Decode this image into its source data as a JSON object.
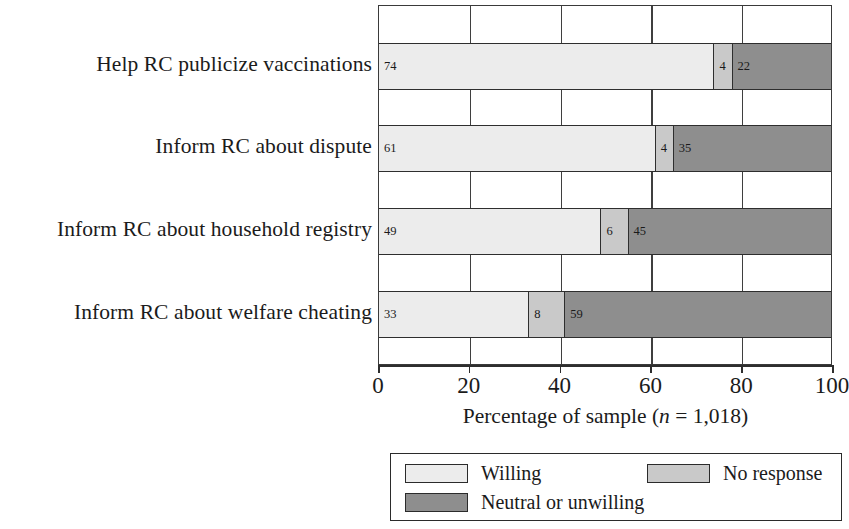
{
  "chart_data": {
    "type": "bar",
    "orientation": "horizontal",
    "stacked": true,
    "title": "",
    "xlabel": "Percentage of sample (n = 1,018)",
    "xlabel_parts": {
      "before": "Percentage of sample (",
      "italic": "n",
      "after": " = 1,018)"
    },
    "ylabel": "",
    "xlim": [
      0,
      100
    ],
    "xticks": [
      0,
      20,
      40,
      60,
      80,
      100
    ],
    "xticklabels": [
      "0",
      "20",
      "40",
      "60",
      "80",
      "100"
    ],
    "grid": true,
    "grid_axis": "x",
    "legend_position": "bottom",
    "sample_size": "1,018",
    "categories": [
      "Help RC publicize vaccinations",
      "Inform RC about dispute",
      "Inform RC about household registry",
      "Inform RC about welfare cheating"
    ],
    "series": [
      {
        "name": "Willing",
        "color": "#ececec",
        "values": [
          74,
          61,
          49,
          33
        ]
      },
      {
        "name": "No response",
        "color": "#c9c9c9",
        "values": [
          4,
          4,
          6,
          8
        ]
      },
      {
        "name": "Neutral or unwilling",
        "color": "#8e8e8e",
        "values": [
          22,
          35,
          45,
          59
        ]
      }
    ],
    "bars": [
      {
        "category": "Help RC publicize vaccinations",
        "segments": [
          {
            "label": "74",
            "value": 74,
            "series": "Willing"
          },
          {
            "label": "4",
            "value": 4,
            "series": "No response"
          },
          {
            "label": "22",
            "value": 22,
            "series": "Neutral or unwilling"
          }
        ]
      },
      {
        "category": "Inform RC about dispute",
        "segments": [
          {
            "label": "61",
            "value": 61,
            "series": "Willing"
          },
          {
            "label": "4",
            "value": 4,
            "series": "No response"
          },
          {
            "label": "35",
            "value": 35,
            "series": "Neutral or unwilling"
          }
        ]
      },
      {
        "category": "Inform RC about household registry",
        "segments": [
          {
            "label": "49",
            "value": 49,
            "series": "Willing"
          },
          {
            "label": "6",
            "value": 6,
            "series": "No response"
          },
          {
            "label": "45",
            "value": 45,
            "series": "Neutral or unwilling"
          }
        ]
      },
      {
        "category": "Inform RC about welfare cheating",
        "segments": [
          {
            "label": "33",
            "value": 33,
            "series": "Willing"
          },
          {
            "label": "8",
            "value": 8,
            "series": "No response"
          },
          {
            "label": "59",
            "value": 59,
            "series": "Neutral or unwilling"
          }
        ]
      }
    ],
    "legend": [
      {
        "label": "Willing",
        "color": "#ececec"
      },
      {
        "label": "No response",
        "color": "#c9c9c9"
      },
      {
        "label": "Neutral or unwilling",
        "color": "#8e8e8e"
      }
    ]
  }
}
